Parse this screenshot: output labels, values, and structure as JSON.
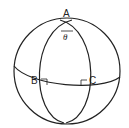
{
  "diagram": {
    "type": "spherical-triangle",
    "points": {
      "A": {
        "label": "A"
      },
      "B": {
        "label": "B"
      },
      "C": {
        "label": "C"
      }
    },
    "angle_label": "θ",
    "right_angles_at": [
      "B",
      "C"
    ],
    "colors": {
      "stroke": "#222222",
      "background": "#ffffff"
    }
  }
}
